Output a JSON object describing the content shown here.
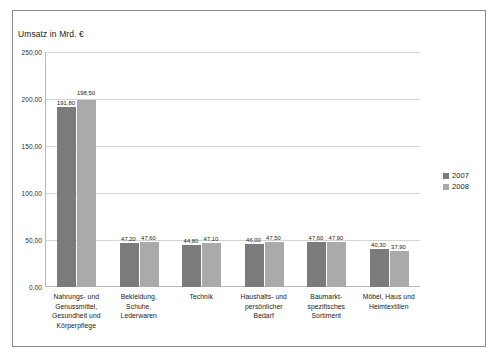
{
  "chart_data": {
    "type": "bar",
    "title": "",
    "axis_title": "Umsatz in Mrd. €",
    "xlabel": "",
    "ylabel": "Umsatz in Mrd. €",
    "ylim": [
      0,
      250
    ],
    "grid": true,
    "legend_position": "right",
    "y_ticks": [
      "0,00",
      "50,00",
      "100,00",
      "150,00",
      "200,00",
      "250,00"
    ],
    "y_tick_values": [
      0,
      50,
      100,
      150,
      200,
      250
    ],
    "categories": [
      "Nahrungs- und Genussmittel, Gesundheit und Körperpflege",
      "Bekleidung, Schuhe, Lederwaren",
      "Technik",
      "Haushalts- und persönlicher Bedarf",
      "Baumarkt-spezifisches Sortiment",
      "Möbel, Haus und Heimtextilien"
    ],
    "categories_lines": [
      [
        "Nahrungs- und",
        "Genussmittel,",
        "Gesundheit und",
        "Körperpflege"
      ],
      [
        "Bekleidung,",
        "Schuhe,",
        "Lederwaren"
      ],
      [
        "Technik"
      ],
      [
        "Haushalts- und",
        "persönlicher",
        "Bedarf"
      ],
      [
        "Baumarkt-",
        "spezifisches",
        "Sortiment"
      ],
      [
        "Möbel, Haus und",
        "Heimtextilien"
      ]
    ],
    "series": [
      {
        "name": "2007",
        "color": "#7b7b7b",
        "values": [
          191.8,
          47.2,
          44.8,
          46.0,
          47.6,
          40.3
        ],
        "labels": [
          "191,80",
          "47,20",
          "44,80",
          "46,00",
          "47,60",
          "40,30"
        ]
      },
      {
        "name": "2008",
        "color": "#aaaaaa",
        "values": [
          198.5,
          47.6,
          47.1,
          47.5,
          47.9,
          37.9
        ],
        "labels": [
          "198,50",
          "47,60",
          "47,10",
          "47,50",
          "47,90",
          "37,90"
        ]
      }
    ]
  },
  "legend": {
    "items": [
      {
        "label": "2007",
        "color": "#7b7b7b"
      },
      {
        "label": "2008",
        "color": "#aaaaaa"
      }
    ]
  }
}
